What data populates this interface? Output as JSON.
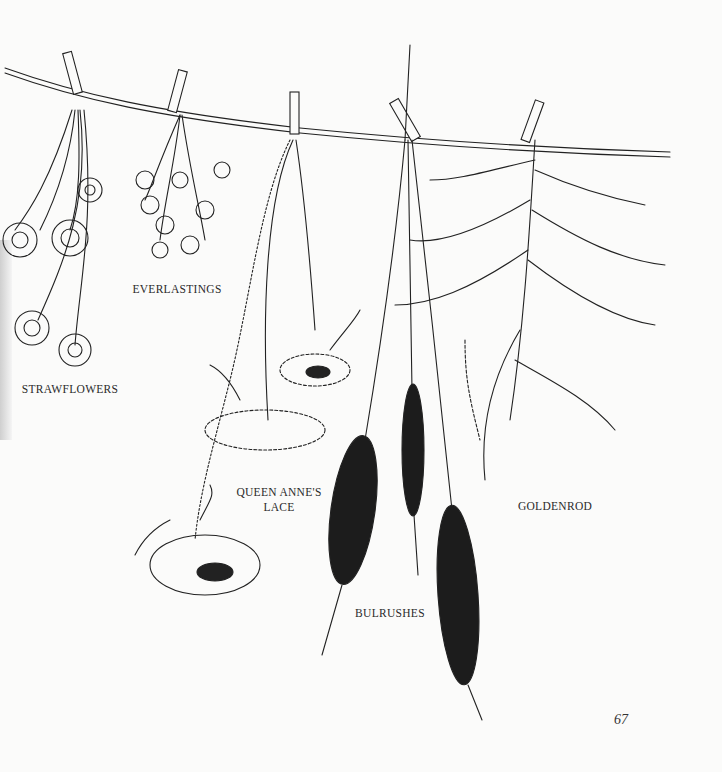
{
  "labels": {
    "strawflowers": "STRAWFLOWERS",
    "everlastings": "EVERLASTINGS",
    "queen_annes_lace_line1": "QUEEN ANNE'S",
    "queen_annes_lace_line2": "LACE",
    "bulrushes": "BULRUSHES",
    "goldenrod": "GOLDENROD"
  },
  "page_number": "67"
}
